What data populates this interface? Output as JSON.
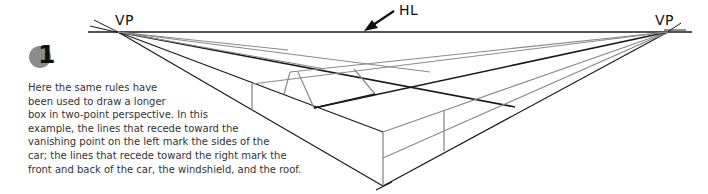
{
  "labels": {
    "left_vp": "VP",
    "right_vp": "VP",
    "horizon": "HL"
  },
  "step": {
    "number": "1"
  },
  "caption": {
    "lines": [
      "Here the same rules have",
      "been used to draw a longer",
      "box in two-point perspective. In this",
      "example, the lines that recede toward the",
      "vanishing point on the left mark the sides of the",
      "car; the lines that recede toward the right mark the",
      "front and back of the car, the windshield, and the roof."
    ]
  },
  "colors": {
    "dark_line": "#1a1a1a",
    "gray_line": "#8a8a8a",
    "badge": "#8c8c8c",
    "text": "#333333"
  }
}
